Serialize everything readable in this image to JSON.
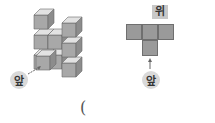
{
  "left_figure": {
    "description": "isometric stacked cube structure",
    "front_label": "앞",
    "colors": {
      "top": "#e2e2e2",
      "front": "#a8a8a8",
      "side": "#8c8c8c",
      "edge": "#6a6a6a"
    }
  },
  "right_figure": {
    "top_label": "위",
    "front_label": "앞",
    "grid": [
      [
        1,
        1,
        1
      ],
      [
        0,
        1,
        0
      ]
    ],
    "cell_color": "#9a9a9a"
  },
  "answer_blank": {
    "open_paren": "("
  }
}
